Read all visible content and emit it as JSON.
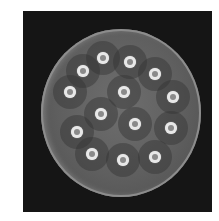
{
  "image": {
    "subject": "petri-dish-antibiotic-disk-diffusion",
    "background_color": "#ffffff",
    "frame_color": "#151515",
    "agar_color": "#626262",
    "disk_color": "#e8e8e8",
    "disks": [
      {
        "x": 103,
        "y": 58
      },
      {
        "x": 130,
        "y": 62
      },
      {
        "x": 83,
        "y": 71
      },
      {
        "x": 155,
        "y": 74
      },
      {
        "x": 70,
        "y": 92
      },
      {
        "x": 124,
        "y": 92
      },
      {
        "x": 173,
        "y": 97
      },
      {
        "x": 101,
        "y": 114
      },
      {
        "x": 135,
        "y": 124
      },
      {
        "x": 77,
        "y": 132
      },
      {
        "x": 171,
        "y": 128
      },
      {
        "x": 92,
        "y": 154
      },
      {
        "x": 123,
        "y": 160
      },
      {
        "x": 155,
        "y": 157
      }
    ]
  }
}
